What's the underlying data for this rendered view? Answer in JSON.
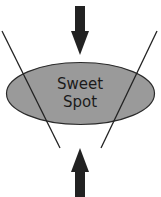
{
  "diagram": {
    "type": "funnel-convergence",
    "center_shape": {
      "label_line1": "Sweet",
      "label_line2": "Spot",
      "fill": "#9a9a9a",
      "stroke": "#2a2a2a"
    },
    "arrows": [
      {
        "direction": "down",
        "position": "top",
        "color": "#222222"
      },
      {
        "direction": "up",
        "position": "bottom",
        "color": "#222222"
      }
    ],
    "lines": [
      {
        "side": "left",
        "color": "#222222"
      },
      {
        "side": "right",
        "color": "#222222"
      }
    ]
  }
}
